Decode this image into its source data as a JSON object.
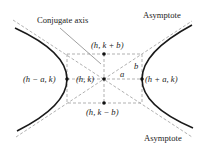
{
  "diagram": {
    "type": "hyperbola",
    "colors": {
      "curve": "#1a1a1a",
      "dashed": "#a8a8a8",
      "leader": "#777777",
      "text": "#222222"
    },
    "labels": {
      "conjugate_axis": "Conjugate axis",
      "asymptote_top": "Asymptote",
      "asymptote_bottom": "Asymptote",
      "center": "(h, k)",
      "top_point": "(h, k + b)",
      "bottom_point": "(h, k − b)",
      "left_vertex": "(h − a, k)",
      "right_vertex": "(h + a, k)",
      "a": "a",
      "b": "b"
    }
  }
}
